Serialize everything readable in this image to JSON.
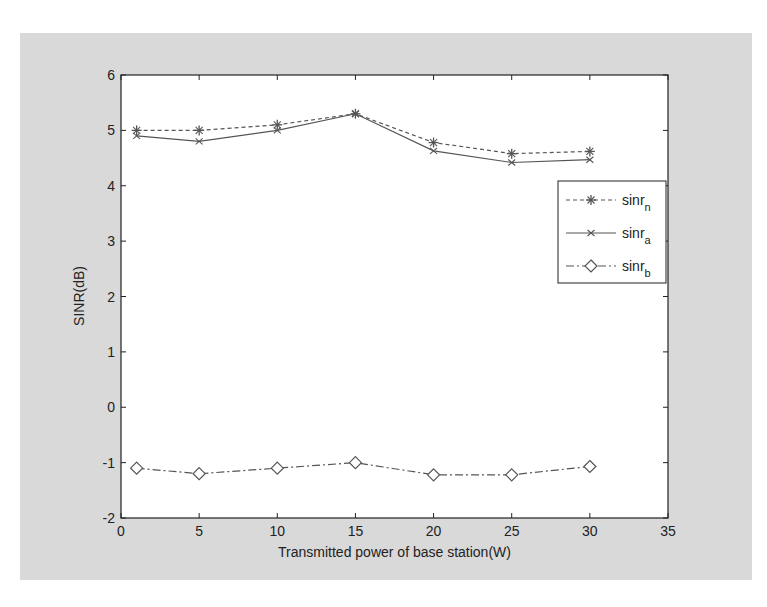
{
  "chart_data": {
    "type": "line",
    "title": "",
    "xlabel": "Transmitted power of base station(W)",
    "ylabel": "SINR(dB)",
    "xlim": [
      0,
      35
    ],
    "ylim": [
      -2,
      6
    ],
    "xticks": [
      0,
      5,
      10,
      15,
      20,
      25,
      30,
      35
    ],
    "yticks": [
      -2,
      -1,
      0,
      1,
      2,
      3,
      4,
      5,
      6
    ],
    "grid": false,
    "legend_position": "right-center",
    "x": [
      1,
      5,
      10,
      15,
      20,
      25,
      30
    ],
    "series": [
      {
        "name": "sinr_n",
        "label_base": "sinr",
        "label_sub": "n",
        "style": "dashed",
        "marker": "star",
        "color": "#555555",
        "values": [
          5.0,
          5.0,
          5.1,
          5.3,
          4.78,
          4.58,
          4.62
        ]
      },
      {
        "name": "sinr_a",
        "label_base": "sinr",
        "label_sub": "a",
        "style": "solid",
        "marker": "x",
        "color": "#555555",
        "values": [
          4.9,
          4.8,
          5.0,
          5.3,
          4.63,
          4.42,
          4.47
        ]
      },
      {
        "name": "sinr_b",
        "label_base": "sinr",
        "label_sub": "b",
        "style": "dashdot",
        "marker": "diamond",
        "color": "#555555",
        "values": [
          -1.1,
          -1.2,
          -1.1,
          -1.0,
          -1.22,
          -1.22,
          -1.07
        ]
      }
    ]
  }
}
